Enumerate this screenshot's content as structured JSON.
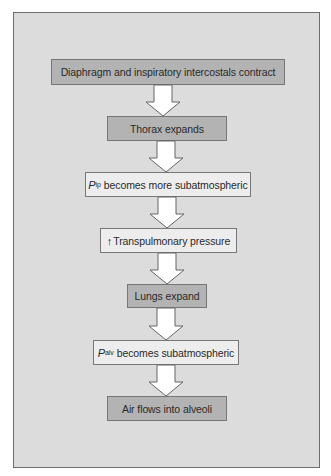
{
  "diagram": {
    "type": "flowchart",
    "direction": "top-to-bottom",
    "colors": {
      "background": "#dcdcdc",
      "frame_border": "#6e6e6e",
      "dark_box": "#b3b3b3",
      "light_box": "#ededed",
      "arrow_fill": "#ffffff",
      "arrow_stroke": "#666666"
    },
    "steps": [
      {
        "id": 1,
        "text": "Diaphragm and inspiratory intercostals contract",
        "style": "dark"
      },
      {
        "id": 2,
        "text": "Thorax expands",
        "style": "dark"
      },
      {
        "id": 3,
        "symbol": "P",
        "subscript": "ip",
        "text": "becomes more subatmospheric",
        "style": "light"
      },
      {
        "id": 4,
        "prefix_icon": "up-arrow",
        "prefix_glyph": "↑",
        "text": "Transpulmonary pressure",
        "style": "light"
      },
      {
        "id": 5,
        "text": "Lungs expand",
        "style": "dark"
      },
      {
        "id": 6,
        "symbol": "P",
        "subscript": "alv",
        "text": "becomes subatmospheric",
        "style": "light"
      },
      {
        "id": 7,
        "text": "Air flows into alveoli",
        "style": "dark"
      }
    ],
    "edges": [
      {
        "from": 1,
        "to": 2
      },
      {
        "from": 2,
        "to": 3
      },
      {
        "from": 3,
        "to": 4
      },
      {
        "from": 4,
        "to": 5
      },
      {
        "from": 5,
        "to": 6
      },
      {
        "from": 6,
        "to": 7
      }
    ]
  }
}
